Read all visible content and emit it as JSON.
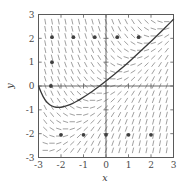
{
  "chart_data": {
    "type": "line",
    "title": "",
    "subtitle": "",
    "xlabel": "x",
    "ylabel": "y",
    "xlim": [
      -3,
      3
    ],
    "ylim": [
      -3,
      3
    ],
    "xticks": [
      -3,
      -2,
      -1,
      0,
      1,
      2,
      3
    ],
    "yticks": [
      -3,
      -2,
      -1,
      0,
      1,
      2,
      3
    ],
    "xtick_labels": [
      "-3",
      "-2",
      "-1",
      "0",
      "1",
      "2",
      "3"
    ],
    "ytick_labels": [
      "-3",
      "-2",
      "-1",
      "0",
      "1",
      "2",
      "3"
    ],
    "grid": false,
    "legend": "none",
    "plot_kind": "slope-field-with-solution-curve",
    "slope_field": {
      "description": "direction field of dy/dx = x - y",
      "equation": "dy/dx = x - y",
      "segment_color": "#8f8f8f",
      "nx": 19,
      "ny": 19,
      "segment_length": 0.24
    },
    "solution_curve": {
      "name": "particular solution",
      "equation": "y = x - 1 + 2*exp(-(x+3))",
      "color": "#3a3a3a",
      "x": [
        -3.0,
        -2.8,
        -2.6,
        -2.4,
        -2.2,
        -2.0,
        -1.8,
        -1.6,
        -1.4,
        -1.2,
        -1.0,
        -0.8,
        -0.6,
        -0.4,
        -0.2,
        0.0,
        0.25,
        0.5,
        0.75,
        1.0,
        1.25,
        1.5,
        1.75,
        2.0,
        2.25,
        2.5,
        2.75,
        3.0
      ],
      "y": [
        0.0,
        -0.46,
        -0.72,
        -0.85,
        -0.9,
        -0.89,
        -0.85,
        -0.78,
        -0.69,
        -0.59,
        -0.47,
        -0.35,
        -0.22,
        -0.08,
        0.06,
        0.21,
        0.4,
        0.59,
        0.79,
        1.0,
        1.21,
        1.43,
        1.65,
        1.87,
        2.1,
        2.33,
        2.56,
        2.8
      ]
    },
    "markers": {
      "label": "sample / initial-condition points",
      "color": "#3f3f3f",
      "points": [
        [
          -2.4,
          2.05
        ],
        [
          -1.45,
          2.05
        ],
        [
          -0.5,
          2.05
        ],
        [
          0.5,
          2.05
        ],
        [
          1.45,
          2.05
        ],
        [
          -2.4,
          1.0
        ],
        [
          -2.45,
          0.0
        ],
        [
          -2.0,
          -2.05
        ],
        [
          -1.0,
          -2.05
        ],
        [
          0.0,
          -2.05
        ],
        [
          1.0,
          -2.05
        ],
        [
          2.0,
          -2.05
        ]
      ]
    }
  },
  "figure": {
    "name": "slope-field-plot",
    "background": "#ffffff",
    "frame_color": "#5a5a5a",
    "width": 186,
    "height": 189
  }
}
